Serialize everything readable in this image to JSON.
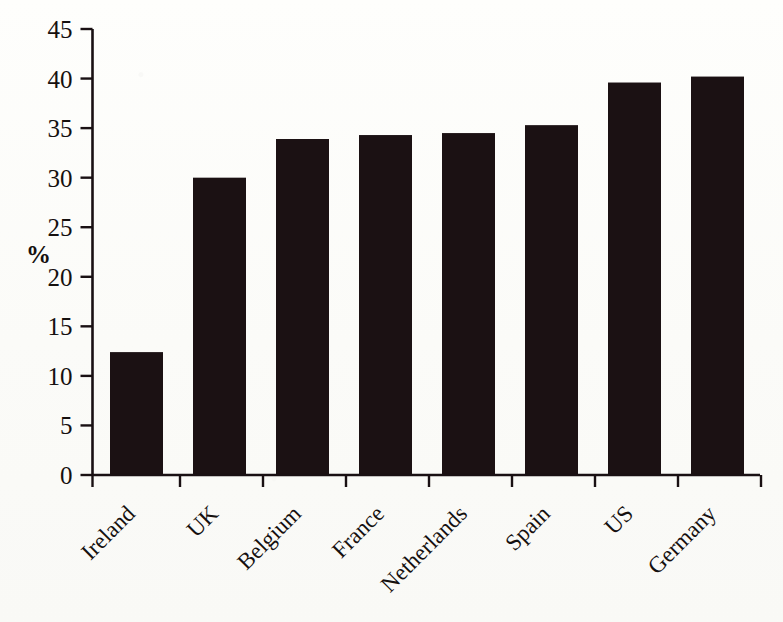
{
  "chart_data": {
    "type": "bar",
    "title": "",
    "subtitle": "",
    "xlabel": "",
    "ylabel": "%",
    "categories": [
      "Ireland",
      "UK",
      "Belgium",
      "France",
      "Netherlands",
      "Spain",
      "US",
      "Germany"
    ],
    "values": [
      12.4,
      30.0,
      33.9,
      34.3,
      34.5,
      35.3,
      39.6,
      40.2
    ],
    "series": [
      {
        "name": "",
        "values": [
          12.4,
          30.0,
          33.9,
          34.3,
          34.5,
          35.3,
          39.6,
          40.2
        ]
      }
    ],
    "ylim": [
      0,
      45
    ],
    "ytick_labels": [
      "0",
      "5",
      "10",
      "15",
      "20",
      "25",
      "30",
      "35",
      "40",
      "45"
    ],
    "ytick_values": [
      0,
      5,
      10,
      15,
      20,
      25,
      30,
      35,
      40,
      45
    ],
    "grid": false,
    "legend": false,
    "legend_position": "none",
    "xtick_label_rotation": 45,
    "annotations": [],
    "colors": {
      "bar": "#1b1113",
      "axis": "#191013",
      "text": "#15100f",
      "background": "#fdfdfb"
    }
  }
}
